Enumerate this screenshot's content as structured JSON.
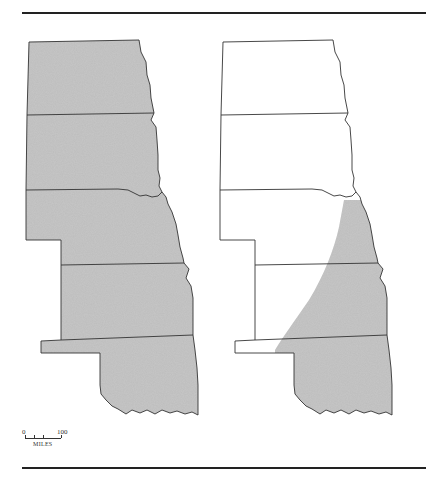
{
  "figure": {
    "type": "paired-region-map",
    "states": [
      "North Dakota",
      "South Dakota",
      "Nebraska",
      "Kansas",
      "Oklahoma"
    ],
    "left_map": {
      "description": "All five Great Plains states shaded",
      "fill_color": "#bdbdbd",
      "shaded": "entire region"
    },
    "right_map": {
      "description": "Outline map with shaded range in southeast portion",
      "fill_color": "#bdbdbd",
      "shaded": "eastern Oklahoma, southeastern Kansas, extreme southeastern Nebraska"
    },
    "outline_color": "#333333"
  },
  "scale": {
    "start_label": "0",
    "end_label": "100",
    "unit_label": "MILES"
  }
}
